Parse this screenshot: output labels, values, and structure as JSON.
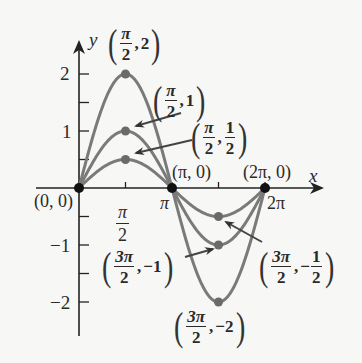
{
  "chart_data": {
    "type": "line",
    "title": "",
    "xlabel": "x",
    "ylabel": "y",
    "xlim": [
      0,
      6.5
    ],
    "ylim": [
      -2.6,
      2.6
    ],
    "grid": false,
    "legend": "none",
    "x_ticks": [
      {
        "value": 1.5708,
        "label_num": "π",
        "label_den": "2"
      },
      {
        "value": 3.1416,
        "label": "π"
      },
      {
        "value": 4.7124,
        "label": ""
      },
      {
        "value": 6.2832,
        "label": "2π"
      }
    ],
    "y_ticks": [
      {
        "value": 2,
        "label": "2"
      },
      {
        "value": 1.5,
        "label": ""
      },
      {
        "value": 1,
        "label": "1"
      },
      {
        "value": 0.5,
        "label": ""
      },
      {
        "value": -0.5,
        "label": ""
      },
      {
        "value": -1,
        "label": "−1"
      },
      {
        "value": -1.5,
        "label": ""
      },
      {
        "value": -2,
        "label": "−2"
      }
    ],
    "series": [
      {
        "name": "y = 2 sin x",
        "amplitude": 2,
        "x_range": [
          0,
          6.2832
        ]
      },
      {
        "name": "y = sin x",
        "amplitude": 1,
        "x_range": [
          0,
          6.2832
        ]
      },
      {
        "name": "y = ½ sin x",
        "amplitude": 0.5,
        "x_range": [
          0,
          6.2832
        ]
      }
    ],
    "annotations": [
      {
        "x": 0,
        "y": 0,
        "label": "(0, 0)"
      },
      {
        "x": 3.1416,
        "y": 0,
        "label": "(π, 0)"
      },
      {
        "x": 6.2832,
        "y": 0,
        "label": "(2π, 0)"
      },
      {
        "x": 1.5708,
        "y": 2,
        "label": "(π/2, 2)"
      },
      {
        "x": 1.5708,
        "y": 1,
        "label": "(π/2, 1)"
      },
      {
        "x": 1.5708,
        "y": 0.5,
        "label": "(π/2, 1/2)"
      },
      {
        "x": 4.7124,
        "y": -1,
        "label": "(3π/2, −1)"
      },
      {
        "x": 4.7124,
        "y": -0.5,
        "label": "(3π/2, −1/2)"
      },
      {
        "x": 4.7124,
        "y": -2,
        "label": "(3π/2, −2)"
      }
    ],
    "colors": {
      "curve": "#7a7a7a",
      "axis": "#222222",
      "point": "#111111",
      "point_gray": "#6a6a6a",
      "background": "#f7f7f5"
    }
  },
  "labels": {
    "y_axis": "y",
    "x_axis": "x",
    "origin": "(0, 0)",
    "pi_zero": "(π, 0)",
    "two_pi_zero": "(2π, 0)",
    "tick_pi": "π",
    "tick_two_pi": "2π",
    "tick_pi_half_num": "π",
    "tick_pi_half_den": "2",
    "tick_y2": "2",
    "tick_y1": "1",
    "tick_ym1": "−1",
    "tick_ym2": "−2",
    "p_max2": {
      "num": "π",
      "den": "2",
      "val": "2"
    },
    "p_max1": {
      "num": "π",
      "den": "2",
      "val": "1"
    },
    "p_maxh": {
      "num": "π",
      "den": "2",
      "vnum": "1",
      "vden": "2"
    },
    "p_min1": {
      "num": "3π",
      "den": "2",
      "val": "−1"
    },
    "p_minh": {
      "num": "3π",
      "den": "2",
      "vnum": "1",
      "vden": "2",
      "sign": "−"
    },
    "p_min2": {
      "num": "3π",
      "den": "2",
      "val": "−2"
    }
  }
}
